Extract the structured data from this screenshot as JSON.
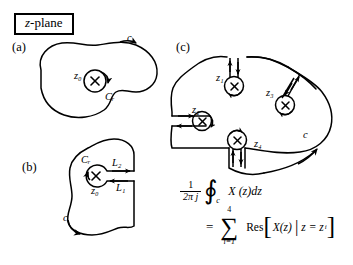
{
  "figure": {
    "title_box": {
      "italic_prefix": "z",
      "rest": "-plane"
    },
    "panels": [
      {
        "id": "a",
        "label": "(a)",
        "contour_label": "c",
        "pole_label": "z₀",
        "inner_contour_label": "Cᵣ",
        "description": "simple closed contour c enclosing one pole z0 with small circle Cr"
      },
      {
        "id": "b",
        "label": "(b)",
        "contour_label": "c",
        "pole_label": "z₀",
        "inner_contour_label": "Cᵣ",
        "cut_labels": [
          "L₂",
          "L₁"
        ],
        "description": "keyhole contour with cut lines L1 and L2 to the pole"
      },
      {
        "id": "c",
        "label": "(c)",
        "contour_label": "c",
        "pole_labels": [
          "z₁",
          "z₂",
          "z₃",
          "z₄"
        ],
        "description": "contour c enclosing four poles each with a cut"
      }
    ],
    "formula": {
      "numerator": "1",
      "denominator": "2π j",
      "integral_symbol": "∮",
      "integral_subscript": "c",
      "integrand": "X (z)dz",
      "equals": "=",
      "sigma_symbol": "∑",
      "sigma_upper": "4",
      "sigma_lower": "i=1",
      "residue_word": "Res",
      "bracket_open": "[",
      "bracket_close": "]",
      "residue_arg": "X(z)",
      "separator": "|",
      "condition": "z = z",
      "condition_sub": "i"
    },
    "colors": {
      "ink": "#000000",
      "background": "#ffffff"
    }
  }
}
